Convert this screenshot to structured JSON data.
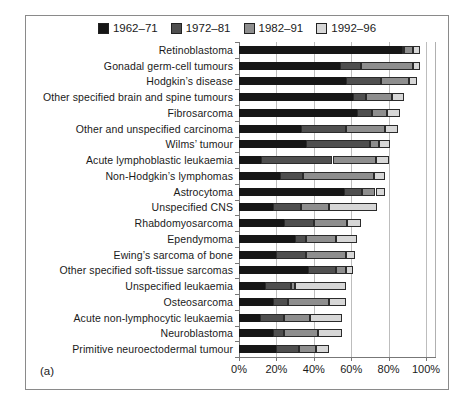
{
  "figure": {
    "panel_label": "(a)"
  },
  "chart_data": {
    "type": "bar",
    "variant": "horizontal-stacked",
    "title": "",
    "xlabel": "",
    "ylabel": "",
    "xlim": [
      0,
      100
    ],
    "x_tick_values": [
      0,
      20,
      40,
      60,
      80,
      100
    ],
    "x_tick_labels": [
      "0%",
      "20%",
      "40%",
      "60%",
      "80%",
      "100%"
    ],
    "grid": "vertical gridlines every 20%",
    "legend_position": "top",
    "legend": [
      {
        "label": "1962–71",
        "color": "#161616"
      },
      {
        "label": "1972–81",
        "color": "#4f4f4f"
      },
      {
        "label": "1982–91",
        "color": "#8e8e8e"
      },
      {
        "label": "1992–96",
        "color": "#d7d7d7"
      }
    ],
    "categories": [
      "Retinoblastoma",
      "Gonadal germ-cell tumours",
      "Hodgkin’s disease",
      "Other specified brain and spine tumours",
      "Fibrosarcoma",
      "Other and unspecified carcinoma",
      "Wilms’ tumour",
      "Acute lymphoblastic leukaemia",
      "Non-Hodgkin’s lymphomas",
      "Astrocytoma",
      "Unspecified CNS",
      "Rhabdomyosarcoma",
      "Ependymoma",
      "Ewing’s sarcoma of bone",
      "Other specified soft-tissue sarcomas",
      "Unspecified leukaemia",
      "Osteosarcoma",
      "Acute non-lymphocytic leukaemia",
      "Neuroblastoma",
      "Primitive neuroectodermal tumour"
    ],
    "series": [
      {
        "name": "1962–71",
        "color": "#161616",
        "cumulative_percent": [
          87,
          54,
          57,
          61,
          63,
          33,
          36,
          12,
          22,
          56,
          18,
          24,
          30,
          20,
          37,
          14,
          18,
          11,
          18,
          20
        ]
      },
      {
        "name": "1972–81",
        "color": "#4f4f4f",
        "cumulative_percent": [
          88,
          65,
          76,
          68,
          71,
          57,
          70,
          50,
          34,
          66,
          33,
          40,
          36,
          36,
          52,
          28,
          26,
          24,
          24,
          32
        ]
      },
      {
        "name": "1982–91",
        "color": "#8e8e8e",
        "cumulative_percent": [
          93,
          93,
          91,
          82,
          79,
          78,
          75,
          73,
          72,
          73,
          48,
          58,
          52,
          57,
          57,
          30,
          48,
          38,
          42,
          41
        ]
      },
      {
        "name": "1992–96",
        "color": "#d7d7d7",
        "cumulative_percent": [
          97,
          97,
          95,
          88,
          86,
          85,
          81,
          80,
          78,
          78,
          74,
          65,
          63,
          62,
          61,
          57,
          57,
          55,
          55,
          48
        ]
      }
    ]
  }
}
